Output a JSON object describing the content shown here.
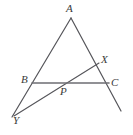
{
  "figure": {
    "kind": "geometry-diagram",
    "background_color": "#ffffff",
    "stroke_color": "#55555a",
    "base_stroke_color": "#6e6e73",
    "label_color": "#3a3a3a"
  },
  "points": [
    {
      "id": "A",
      "label": "A",
      "x": 71,
      "y": 18,
      "label_x": 66,
      "label_y": 3
    },
    {
      "id": "B",
      "label": "B",
      "x": 32,
      "y": 83,
      "label_x": 21,
      "label_y": 74
    },
    {
      "id": "C",
      "label": "C",
      "x": 108,
      "y": 83,
      "label_x": 111,
      "label_y": 77
    },
    {
      "id": "X",
      "label": "X",
      "x": 98,
      "y": 64,
      "label_x": 101,
      "label_y": 54
    },
    {
      "id": "P",
      "label": "P",
      "x": 64,
      "y": 83,
      "label_x": 60,
      "label_y": 86
    },
    {
      "id": "Y",
      "label": "Y",
      "x": 15,
      "y": 113,
      "label_x": 13,
      "label_y": 115
    }
  ],
  "segments": [
    {
      "id": "A-Y",
      "name": "line-a-to-y",
      "x1": 71,
      "y1": 18,
      "x2": 12,
      "y2": 117,
      "width": 1.2,
      "color": "#55555a"
    },
    {
      "id": "A-ext",
      "name": "line-a-through-c",
      "x1": 71,
      "y1": 18,
      "x2": 121,
      "y2": 111,
      "width": 1.2,
      "color": "#55555a"
    },
    {
      "id": "Y-X",
      "name": "line-y-through-p-to-x",
      "x1": 14,
      "y1": 116,
      "x2": 99,
      "y2": 63,
      "width": 1.1,
      "color": "#55555a"
    },
    {
      "id": "B-C",
      "name": "segment-b-to-c",
      "x1": 32,
      "y1": 83,
      "x2": 109,
      "y2": 83,
      "width": 1.6,
      "color": "#6e6e73"
    }
  ]
}
